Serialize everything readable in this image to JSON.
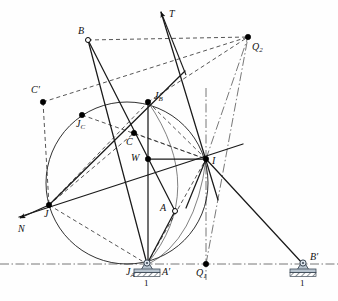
{
  "figure": {
    "width": 338,
    "height": 301,
    "background": "#fefefe",
    "colors": {
      "line": "#1a1a1a",
      "thin": "#4a4a4a",
      "dash": "#2b2b2b",
      "dashdot": "#555555",
      "support_body": "#b8c4cf",
      "support_outline": "#3d4a57",
      "ground_hatch": "#2f3a45",
      "point_fill": "#000000",
      "open_fill": "#ffffff"
    }
  },
  "points": [
    {
      "id": "B",
      "label": "B",
      "sub": "",
      "x": 88,
      "y": 40,
      "marker": "open",
      "lx": 78,
      "ly": 26
    },
    {
      "id": "Q2",
      "label": "Q",
      "sub": "2",
      "x": 248,
      "y": 37,
      "marker": "filled",
      "lx": 252,
      "ly": 42
    },
    {
      "id": "Cp",
      "label": "C",
      "sub": "",
      "x": 43,
      "y": 102,
      "marker": "filled",
      "lx": 31,
      "ly": 85,
      "prime": true
    },
    {
      "id": "JB",
      "label": "J",
      "sub": "B",
      "x": 148,
      "y": 102,
      "marker": "filled",
      "lx": 154,
      "ly": 91
    },
    {
      "id": "JC",
      "label": "J",
      "sub": "C",
      "x": 82,
      "y": 115,
      "marker": "filled",
      "lx": 76,
      "ly": 119
    },
    {
      "id": "C",
      "label": "C",
      "sub": "",
      "x": 134,
      "y": 133,
      "marker": "filled",
      "lx": 126,
      "ly": 137
    },
    {
      "id": "W",
      "label": "W",
      "sub": "",
      "x": 148,
      "y": 159,
      "marker": "filled",
      "lx": 131,
      "ly": 153
    },
    {
      "id": "I",
      "label": "I",
      "sub": "",
      "x": 206,
      "y": 159,
      "marker": "filled",
      "lx": 212,
      "ly": 156
    },
    {
      "id": "J",
      "label": "J",
      "sub": "",
      "x": 49,
      "y": 205,
      "marker": "filled",
      "lx": 44,
      "ly": 209
    },
    {
      "id": "A",
      "label": "A",
      "sub": "",
      "x": 175,
      "y": 211,
      "marker": "open",
      "lx": 160,
      "ly": 203
    },
    {
      "id": "JA",
      "label": "J",
      "sub": "A",
      "x": 147,
      "y": 264,
      "marker": "none",
      "lx": 126,
      "ly": 267
    },
    {
      "id": "Ap",
      "label": "A",
      "sub": "",
      "x": 166,
      "y": 264,
      "marker": "none",
      "lx": 162,
      "ly": 267,
      "prime": true
    },
    {
      "id": "Q1",
      "label": "Q",
      "sub": "1",
      "x": 206,
      "y": 264,
      "marker": "filled",
      "lx": 196,
      "ly": 268
    },
    {
      "id": "Bp",
      "label": "B",
      "sub": "",
      "x": 303,
      "y": 264,
      "marker": "none",
      "lx": 310,
      "ly": 252,
      "prime": true
    }
  ],
  "arrows": [
    {
      "id": "T",
      "label": "T",
      "tip_x": 161,
      "tip_y": 12,
      "tail_x": 186,
      "tail_y": 75,
      "lx": 169,
      "ly": 9
    },
    {
      "id": "N",
      "label": "N",
      "tip_x": 20,
      "tip_y": 218,
      "tail_x": 49,
      "tail_y": 205,
      "lx": 18,
      "ly": 224
    }
  ],
  "supports": [
    {
      "id": "support-A",
      "x": 147,
      "y": 264,
      "tag": "1",
      "tag_x": 144,
      "tag_y": 279
    },
    {
      "id": "support-B",
      "x": 303,
      "y": 264,
      "tag": "1",
      "tag_x": 300,
      "tag_y": 279
    }
  ],
  "circles": [
    {
      "id": "main-circle",
      "cx": 127,
      "cy": 183,
      "r": 81,
      "style": "solid-thin"
    }
  ],
  "arcs": [
    {
      "id": "arc-JB-JA",
      "d": "M 148 102 Q 208 190 147 264",
      "style": "solid-hair"
    },
    {
      "id": "arc-I-JA",
      "d": "M 206 159 Q 196 240 147 265",
      "style": "solid-hair"
    }
  ],
  "solid_lines": [
    {
      "id": "B-JA",
      "x1": 88,
      "y1": 40,
      "x2": 147,
      "y2": 264
    },
    {
      "id": "B-A",
      "x1": 88,
      "y1": 40,
      "x2": 175,
      "y2": 211
    },
    {
      "id": "A-JA",
      "x1": 175,
      "y1": 211,
      "x2": 147,
      "y2": 264
    },
    {
      "id": "I-Bp",
      "x1": 206,
      "y1": 159,
      "x2": 303,
      "y2": 264
    },
    {
      "id": "J-I-ext",
      "x1": 19,
      "y1": 217,
      "x2": 243,
      "y2": 144
    },
    {
      "id": "T-line",
      "x1": 161,
      "y1": 12,
      "x2": 218,
      "y2": 200
    },
    {
      "id": "W-I",
      "x1": 148,
      "y1": 159,
      "x2": 206,
      "y2": 159
    },
    {
      "id": "JB-W",
      "x1": 148,
      "y1": 102,
      "x2": 148,
      "y2": 264
    },
    {
      "id": "J-JB",
      "x1": 49,
      "y1": 205,
      "x2": 185,
      "y2": 71
    },
    {
      "id": "I-down",
      "x1": 206,
      "y1": 159,
      "x2": 186,
      "y2": 208
    }
  ],
  "dashed_lines": [
    {
      "id": "B-Q2",
      "x1": 88,
      "y1": 40,
      "x2": 248,
      "y2": 37
    },
    {
      "id": "Cp-Q2",
      "x1": 43,
      "y1": 102,
      "x2": 248,
      "y2": 37
    },
    {
      "id": "JB-Q2",
      "x1": 148,
      "y1": 102,
      "x2": 248,
      "y2": 37
    },
    {
      "id": "Cp-J",
      "x1": 43,
      "y1": 102,
      "x2": 49,
      "y2": 205
    },
    {
      "id": "JC-I",
      "x1": 82,
      "y1": 115,
      "x2": 206,
      "y2": 159
    },
    {
      "id": "J-JB-d",
      "x1": 49,
      "y1": 205,
      "x2": 148,
      "y2": 102
    },
    {
      "id": "J-C",
      "x1": 49,
      "y1": 205,
      "x2": 134,
      "y2": 133
    },
    {
      "id": "J-JA",
      "x1": 49,
      "y1": 205,
      "x2": 147,
      "y2": 264
    },
    {
      "id": "JA-I",
      "x1": 147,
      "y1": 264,
      "x2": 206,
      "y2": 159
    },
    {
      "id": "C-I",
      "x1": 134,
      "y1": 133,
      "x2": 206,
      "y2": 159
    },
    {
      "id": "JB-I",
      "x1": 148,
      "y1": 102,
      "x2": 206,
      "y2": 159
    }
  ],
  "dashdot_lines": [
    {
      "id": "baseline",
      "x1": 0,
      "y1": 264,
      "x2": 338,
      "y2": 264
    },
    {
      "id": "vertical",
      "x1": 206,
      "y1": 88,
      "x2": 206,
      "y2": 280
    },
    {
      "id": "I-Q2",
      "x1": 206,
      "y1": 159,
      "x2": 248,
      "y2": 37
    },
    {
      "id": "Q1-Q2",
      "x1": 206,
      "y1": 264,
      "x2": 248,
      "y2": 37
    }
  ]
}
